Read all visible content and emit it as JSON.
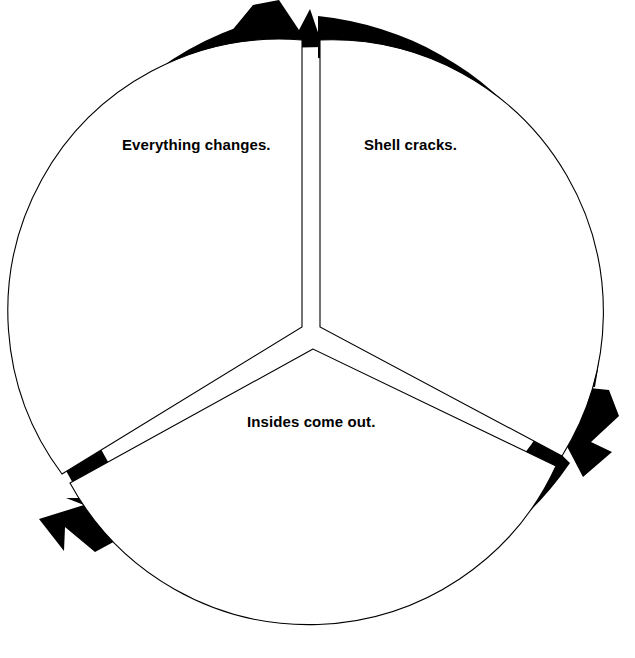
{
  "diagram": {
    "type": "cycle-diagram",
    "background_color": "#ffffff",
    "arrow_color": "#000000",
    "wedge_fill_color": "#ffffff",
    "wedge_stroke_color": "#000000",
    "text_color": "#000000",
    "direction": "clockwise",
    "segment_count": 3,
    "geometry": {
      "center_x": 314,
      "center_y": 330,
      "outer_radius": 314,
      "band_thickness": 42,
      "wedge_radius": 272,
      "canvas_width": 635,
      "canvas_height": 658
    },
    "segments": [
      {
        "id": "segment-shell-cracks",
        "label": "Shell cracks.",
        "order": 1,
        "position": "top-right",
        "arrowhead_tip": "583,477"
      },
      {
        "id": "segment-insides-come-out",
        "label": "Insides come out.",
        "order": 2,
        "position": "bottom",
        "arrowhead_tip": "55,505"
      },
      {
        "id": "segment-everything-changes",
        "label": "Everything changes.",
        "order": 3,
        "position": "top-left",
        "arrowhead_tip": "305,37"
      }
    ]
  }
}
